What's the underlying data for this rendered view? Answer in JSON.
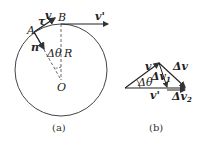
{
  "panel_a": {
    "caption": "(a)",
    "labels": {
      "A": "A",
      "B": "B",
      "O": "O",
      "R": "R",
      "tau": "τ",
      "v": "v",
      "v_prime": "v'",
      "n": "n",
      "dtheta": "Δθ"
    }
  },
  "panel_b": {
    "caption": "(b)",
    "labels": {
      "v": "v",
      "dv": "Δv",
      "dv1": "Δv",
      "dv1_sub": "1",
      "dv2": "Δv",
      "dv2_sub": "2",
      "dtheta": "Δθ",
      "v_prime": "v'"
    }
  },
  "colors": {
    "stroke": "#333333",
    "background": "#ffffff"
  }
}
